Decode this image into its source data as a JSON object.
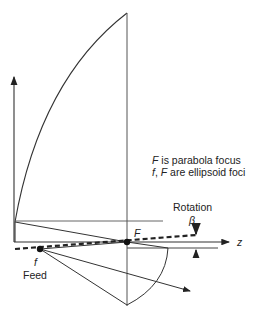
{
  "diagram": {
    "caption_line1_symbol": "F",
    "caption_line1_text": " is parabola focus",
    "caption_line2_symbol1": "f",
    "caption_line2_sep": ", ",
    "caption_line2_symbol2": "F",
    "caption_line2_text": " are ellipsoid foci",
    "rotation_label": "Rotation",
    "beta_label": "β",
    "focus_label": "F",
    "feed_point_label": "f",
    "feed_label": "Feed",
    "axis_label": "z",
    "colors": {
      "stroke": "#333333",
      "background": "#ffffff"
    }
  }
}
